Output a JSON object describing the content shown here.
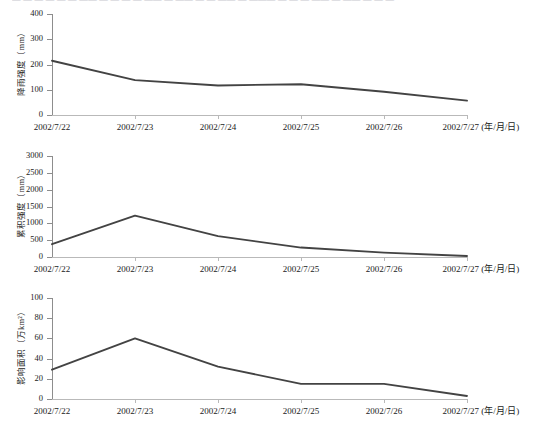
{
  "top_cut_text": "— — — —  — —  —— — — — — —— — —— — — —— — ——— — — — —— — —— — — —",
  "x_axis": {
    "unit_label": "(年/月/日)",
    "categories": [
      "2002/7/22",
      "2002/7/23",
      "2002/7/24",
      "2002/7/25",
      "2002/7/26",
      "2002/7/27"
    ]
  },
  "chart_data": [
    {
      "type": "line",
      "id": "rainfall-intensity",
      "title": "",
      "xlabel": "(年/月/日)",
      "ylabel": "降雨强度（mm）",
      "categories": [
        "2002/7/22",
        "2002/7/23",
        "2002/7/24",
        "2002/7/25",
        "2002/7/26",
        "2002/7/27"
      ],
      "values": [
        215,
        138,
        117,
        122,
        92,
        57
      ],
      "ylim": [
        0,
        400
      ],
      "yticks": [
        0,
        100,
        200,
        300,
        400
      ],
      "grid": false,
      "legend": "none",
      "line_color": "#434343"
    },
    {
      "type": "line",
      "id": "cumulative-intensity",
      "title": "",
      "xlabel": "(年/月/日)",
      "ylabel": "累积强度（mm）",
      "categories": [
        "2002/7/22",
        "2002/7/23",
        "2002/7/24",
        "2002/7/25",
        "2002/7/26",
        "2002/7/27"
      ],
      "values": [
        380,
        1230,
        620,
        280,
        130,
        30
      ],
      "ylim": [
        0,
        3000
      ],
      "yticks": [
        0,
        500,
        1000,
        1500,
        2000,
        2500,
        3000
      ],
      "grid": false,
      "legend": "none",
      "line_color": "#434343"
    },
    {
      "type": "line",
      "id": "affected-area",
      "title": "",
      "xlabel": "(年/月/日)",
      "ylabel": "影响面积（万km²）",
      "categories": [
        "2002/7/22",
        "2002/7/23",
        "2002/7/24",
        "2002/7/25",
        "2002/7/26",
        "2002/7/27"
      ],
      "values": [
        29,
        60,
        32,
        15,
        15,
        3
      ],
      "ylim": [
        0,
        100
      ],
      "yticks": [
        0,
        20,
        40,
        60,
        80,
        100
      ],
      "grid": false,
      "legend": "none",
      "line_color": "#434343"
    }
  ]
}
